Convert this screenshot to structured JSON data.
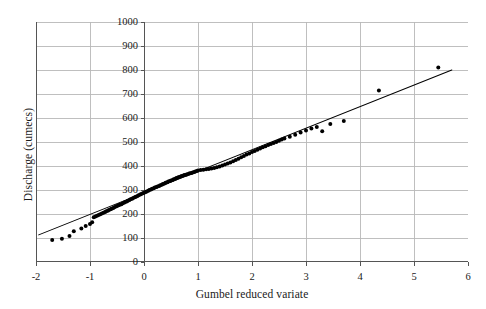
{
  "chart_data": {
    "type": "scatter",
    "title": "",
    "xlabel": "Gumbel reduced variate",
    "ylabel": "Discharge (cumecs)",
    "xlim": [
      -2,
      6
    ],
    "ylim": [
      0,
      1000
    ],
    "xticks": [
      -2,
      -1,
      0,
      1,
      2,
      3,
      4,
      5,
      6
    ],
    "xticklabels": [
      "-2",
      "-1",
      "0",
      "1",
      "2",
      "3",
      "4",
      "5",
      "6"
    ],
    "yticks": [
      0,
      100,
      200,
      300,
      400,
      500,
      600,
      700,
      800,
      900,
      1000
    ],
    "yticklabels": [
      "0",
      "100",
      "200",
      "300",
      "400",
      "500",
      "600",
      "700",
      "800",
      "900",
      "1000"
    ],
    "grid": true,
    "grid_color": "#b8b8b8",
    "axis_color": "#555555",
    "legend": "none",
    "marker_color": "#000000",
    "marker_size": 2.0,
    "series": [
      {
        "name": "Observed annual maximum discharge",
        "type": "scatter",
        "points": [
          [
            -1.7,
            92
          ],
          [
            -1.52,
            97
          ],
          [
            -1.38,
            108
          ],
          [
            -1.3,
            128
          ],
          [
            -1.16,
            140
          ],
          [
            -1.08,
            150
          ],
          [
            -1.0,
            158
          ],
          [
            -0.96,
            166
          ],
          [
            -0.93,
            186
          ],
          [
            -0.9,
            190
          ],
          [
            -0.87,
            193
          ],
          [
            -0.84,
            196
          ],
          [
            -0.81,
            199
          ],
          [
            -0.78,
            202
          ],
          [
            -0.75,
            205
          ],
          [
            -0.72,
            208
          ],
          [
            -0.7,
            211
          ],
          [
            -0.67,
            214
          ],
          [
            -0.65,
            217
          ],
          [
            -0.62,
            220
          ],
          [
            -0.6,
            222
          ],
          [
            -0.57,
            225
          ],
          [
            -0.55,
            228
          ],
          [
            -0.52,
            231
          ],
          [
            -0.5,
            233
          ],
          [
            -0.47,
            236
          ],
          [
            -0.45,
            239
          ],
          [
            -0.42,
            241
          ],
          [
            -0.4,
            244
          ],
          [
            -0.37,
            247
          ],
          [
            -0.35,
            250
          ],
          [
            -0.32,
            252
          ],
          [
            -0.3,
            255
          ],
          [
            -0.27,
            258
          ],
          [
            -0.25,
            261
          ],
          [
            -0.22,
            264
          ],
          [
            -0.2,
            267
          ],
          [
            -0.17,
            270
          ],
          [
            -0.15,
            272
          ],
          [
            -0.12,
            275
          ],
          [
            -0.1,
            278
          ],
          [
            -0.07,
            281
          ],
          [
            -0.05,
            283
          ],
          [
            -0.02,
            286
          ],
          [
            0.0,
            289
          ],
          [
            0.03,
            292
          ],
          [
            0.05,
            294
          ],
          [
            0.08,
            297
          ],
          [
            0.1,
            300
          ],
          [
            0.13,
            302
          ],
          [
            0.15,
            305
          ],
          [
            0.18,
            307
          ],
          [
            0.2,
            310
          ],
          [
            0.23,
            312
          ],
          [
            0.25,
            315
          ],
          [
            0.28,
            317
          ],
          [
            0.3,
            320
          ],
          [
            0.33,
            322
          ],
          [
            0.35,
            325
          ],
          [
            0.38,
            327
          ],
          [
            0.4,
            330
          ],
          [
            0.43,
            332
          ],
          [
            0.45,
            335
          ],
          [
            0.48,
            337
          ],
          [
            0.5,
            340
          ],
          [
            0.53,
            342
          ],
          [
            0.55,
            345
          ],
          [
            0.58,
            347
          ],
          [
            0.6,
            350
          ],
          [
            0.63,
            352
          ],
          [
            0.65,
            354
          ],
          [
            0.68,
            356
          ],
          [
            0.7,
            358
          ],
          [
            0.73,
            360
          ],
          [
            0.75,
            362
          ],
          [
            0.78,
            364
          ],
          [
            0.8,
            366
          ],
          [
            0.83,
            368
          ],
          [
            0.85,
            370
          ],
          [
            0.88,
            371
          ],
          [
            0.9,
            373
          ],
          [
            0.93,
            375
          ],
          [
            0.95,
            377
          ],
          [
            0.98,
            379
          ],
          [
            1.0,
            381
          ],
          [
            1.05,
            383
          ],
          [
            1.1,
            384
          ],
          [
            1.15,
            386
          ],
          [
            1.2,
            388
          ],
          [
            1.25,
            390
          ],
          [
            1.3,
            392
          ],
          [
            1.35,
            395
          ],
          [
            1.4,
            398
          ],
          [
            1.45,
            402
          ],
          [
            1.5,
            406
          ],
          [
            1.55,
            410
          ],
          [
            1.6,
            415
          ],
          [
            1.65,
            420
          ],
          [
            1.7,
            425
          ],
          [
            1.75,
            430
          ],
          [
            1.8,
            436
          ],
          [
            1.85,
            442
          ],
          [
            1.9,
            448
          ],
          [
            1.95,
            452
          ],
          [
            2.0,
            458
          ],
          [
            2.05,
            463
          ],
          [
            2.1,
            468
          ],
          [
            2.15,
            473
          ],
          [
            2.2,
            478
          ],
          [
            2.25,
            482
          ],
          [
            2.3,
            487
          ],
          [
            2.35,
            492
          ],
          [
            2.4,
            496
          ],
          [
            2.45,
            500
          ],
          [
            2.5,
            505
          ],
          [
            2.55,
            510
          ],
          [
            2.6,
            515
          ],
          [
            2.7,
            522
          ],
          [
            2.8,
            530
          ],
          [
            2.9,
            540
          ],
          [
            3.0,
            548
          ],
          [
            3.1,
            556
          ],
          [
            3.2,
            562
          ],
          [
            3.3,
            545
          ],
          [
            3.45,
            575
          ],
          [
            3.7,
            588
          ],
          [
            4.35,
            715
          ],
          [
            5.45,
            810
          ]
        ]
      },
      {
        "name": "Gumbel fitted line",
        "type": "line",
        "points": [
          [
            -1.95,
            113
          ],
          [
            5.7,
            800
          ]
        ]
      }
    ]
  },
  "axes": {
    "xlabel": "Gumbel reduced variate",
    "ylabel": "Discharge (cumecs)"
  }
}
